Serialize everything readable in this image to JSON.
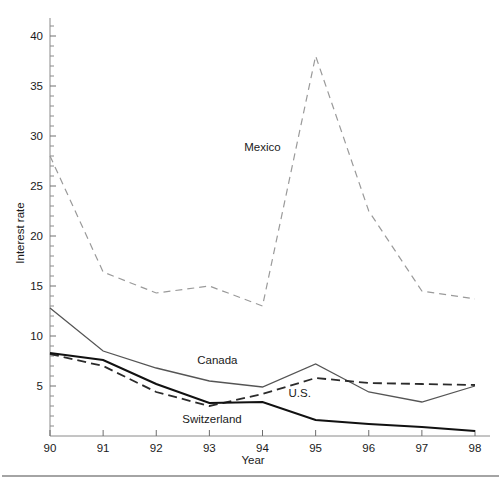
{
  "chart_data": {
    "type": "line",
    "title": "",
    "xlabel": "Year",
    "ylabel": "Interest rate",
    "x": [
      90,
      91,
      92,
      93,
      94,
      95,
      96,
      97,
      98
    ],
    "xtick_labels": [
      "90",
      "91",
      "92",
      "93",
      "94",
      "95",
      "96",
      "97",
      "98"
    ],
    "ytick_labels": [
      "5",
      "10",
      "15",
      "20",
      "25",
      "30",
      "35",
      "40"
    ],
    "ytick_values": [
      5,
      10,
      15,
      20,
      25,
      30,
      35,
      40
    ],
    "xlim": [
      90,
      98
    ],
    "ylim": [
      0,
      41
    ],
    "minor_tick_step": 1,
    "grid": false,
    "legend_position": "inline-annotations",
    "series": [
      {
        "name": "Mexico",
        "values": [
          28.0,
          16.4,
          14.3,
          15.0,
          13.0,
          38.0,
          22.5,
          14.5,
          13.7
        ],
        "style": "dashed",
        "color": "#9a9a9a",
        "width": 1.2,
        "label_x": 94.0,
        "label_y": 28.5
      },
      {
        "name": "Canada",
        "values": [
          12.8,
          8.5,
          6.8,
          5.5,
          4.9,
          7.2,
          4.4,
          3.4,
          5.0
        ],
        "style": "solid",
        "color": "#555555",
        "width": 1.3,
        "label_x": 93.15,
        "label_y": 7.2
      },
      {
        "name": "U.S.",
        "values": [
          8.2,
          7.0,
          4.4,
          3.0,
          4.2,
          5.8,
          5.3,
          5.2,
          5.1
        ],
        "style": "dashed",
        "color": "#2b2b2b",
        "width": 1.8,
        "label_x": 94.7,
        "label_y": 3.9
      },
      {
        "name": "Switzerland",
        "values": [
          8.3,
          7.6,
          5.2,
          3.3,
          3.4,
          1.6,
          1.2,
          0.9,
          0.5
        ],
        "style": "solid",
        "color": "#111111",
        "width": 2.1,
        "label_x": 93.05,
        "label_y": 1.3
      }
    ]
  },
  "axes": {
    "y_title": "Interest rate",
    "x_title": "Year"
  },
  "labels": {
    "mexico": "Mexico",
    "canada": "Canada",
    "us": "U.S.",
    "switzerland": "Switzerland"
  },
  "ticks": {
    "y": [
      "40",
      "35",
      "30",
      "25",
      "20",
      "15",
      "10",
      "5"
    ],
    "x": [
      "90",
      "91",
      "92",
      "93",
      "94",
      "95",
      "96",
      "97",
      "98"
    ]
  },
  "colors": {
    "mexico": "#9a9a9a",
    "canada": "#555555",
    "us": "#2b2b2b",
    "switzerland": "#111111",
    "axis": "#8a8a8a",
    "text": "#1a1a1a",
    "background": "#ffffff"
  }
}
